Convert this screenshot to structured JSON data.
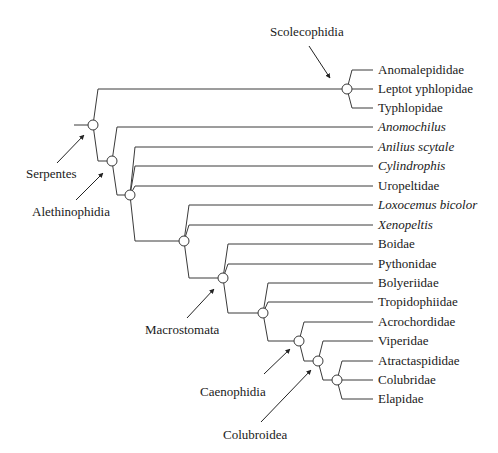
{
  "figure": {
    "type": "phylogenetic-tree"
  },
  "leaves": [
    {
      "id": "anomalepididae",
      "label": "Anomalepididae",
      "italic": false,
      "y": 70
    },
    {
      "id": "leptotyphlopidae",
      "label": "Leptot yphlopidae",
      "italic": false,
      "y": 89
    },
    {
      "id": "typhlopidae",
      "label": "Typhlopidae",
      "italic": false,
      "y": 108
    },
    {
      "id": "anomochilus",
      "label": "Anomochilus",
      "italic": true,
      "y": 127
    },
    {
      "id": "anilius",
      "label": "Anilius scytale",
      "italic": true,
      "y": 147
    },
    {
      "id": "cylindrophis",
      "label": "Cylindrophis",
      "italic": true,
      "y": 166
    },
    {
      "id": "uropeltidae",
      "label": "Uropeltidae",
      "italic": false,
      "y": 186
    },
    {
      "id": "loxocemus",
      "label": "Loxocemus bicolor",
      "italic": true,
      "y": 205
    },
    {
      "id": "xenopeltis",
      "label": "Xenopeltis",
      "italic": true,
      "y": 225
    },
    {
      "id": "boidae",
      "label": "Boidae",
      "italic": false,
      "y": 244
    },
    {
      "id": "pythonidae",
      "label": "Pythonidae",
      "italic": false,
      "y": 264
    },
    {
      "id": "bolyeriidae",
      "label": "Bolyeriidae",
      "italic": false,
      "y": 283
    },
    {
      "id": "tropidophiidae",
      "label": "Tropidophiidae",
      "italic": false,
      "y": 302
    },
    {
      "id": "acrochordidae",
      "label": "Acrochordidae",
      "italic": false,
      "y": 322
    },
    {
      "id": "viperidae",
      "label": "Viperidae",
      "italic": false,
      "y": 341
    },
    {
      "id": "atractaspididae",
      "label": "Atractaspididae",
      "italic": false,
      "y": 361
    },
    {
      "id": "colubridae",
      "label": "Colubridae",
      "italic": false,
      "y": 380
    },
    {
      "id": "elapidae",
      "label": "Elapidae",
      "italic": false,
      "y": 399
    }
  ],
  "clades": [
    {
      "id": "scolecophidia",
      "label": "Scolecophidia"
    },
    {
      "id": "serpentes",
      "label": "Serpentes"
    },
    {
      "id": "alethinophidia",
      "label": "Alethinophidia"
    },
    {
      "id": "macrostomata",
      "label": "Macrostomata"
    },
    {
      "id": "caenophidia",
      "label": "Caenophidia"
    },
    {
      "id": "colubroidea",
      "label": "Colubroidea"
    }
  ]
}
